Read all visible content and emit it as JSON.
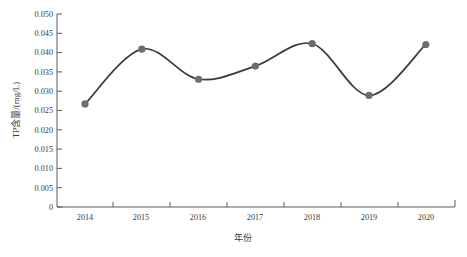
{
  "chart_data": {
    "type": "line",
    "title": "",
    "xlabel": "年份",
    "ylabel": "TP含量/(mg/L)",
    "categories": [
      "2014",
      "2015",
      "2016",
      "2017",
      "2018",
      "2019",
      "2020"
    ],
    "values": [
      0.0267,
      0.0409,
      0.0331,
      0.0365,
      0.0423,
      0.0289,
      0.0421
    ],
    "series": [
      {
        "name": "TP含量",
        "values": [
          0.0267,
          0.0409,
          0.0331,
          0.0365,
          0.0423,
          0.0289,
          0.0421
        ]
      }
    ],
    "ylim": [
      0,
      0.05
    ],
    "ytick_labels": [
      "0",
      "0.005",
      "0.010",
      "0.015",
      "0.020",
      "0.025",
      "0.030",
      "0.035",
      "0.040",
      "0.045",
      "0.050"
    ],
    "ytick_values": [
      0,
      0.005,
      0.01,
      0.015,
      0.02,
      0.025,
      0.03,
      0.035,
      0.04,
      0.045,
      0.05
    ],
    "xtick_labels": [
      "2014",
      "2015",
      "2016",
      "2017",
      "2018",
      "2019",
      "2020"
    ],
    "grid": false,
    "legend": false,
    "legend_position": "none",
    "smoothing": "spline",
    "marker": "circle",
    "line_color": "#3a3a3a",
    "marker_color": "#6d6d6d",
    "axis_color": "#4a4a4a",
    "background_color": "#ffffff"
  }
}
